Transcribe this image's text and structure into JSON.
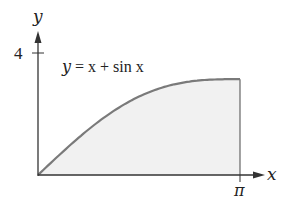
{
  "chart_data": {
    "type": "area",
    "title": "",
    "annotation": "y = x + sin x",
    "xlabel": "x",
    "ylabel": "y",
    "x_ticks": [
      {
        "value": 3.14159,
        "label": "π"
      }
    ],
    "y_ticks": [
      {
        "value": 4,
        "label": "4"
      }
    ],
    "xlim": [
      0,
      3.14159
    ],
    "ylim": [
      0,
      4
    ],
    "grid": false,
    "legend": "none",
    "function": "x + sin(x)",
    "shaded_region": {
      "from": 0,
      "to": 3.14159,
      "description": "area under curve between x=0 and x=π"
    },
    "x": [
      0,
      0.3927,
      0.7854,
      1.1781,
      1.5708,
      1.9635,
      2.3562,
      2.7489,
      3.1416
    ],
    "values": [
      0,
      0.775,
      1.492,
      2.102,
      2.571,
      2.887,
      3.063,
      3.132,
      3.142
    ],
    "colors": {
      "curve": "#7a7a7a",
      "fill": "#f1f1f1",
      "axes": "#333333"
    }
  },
  "labels": {
    "y_axis": "y",
    "x_axis": "x",
    "y_tick": "4",
    "x_tick": "π",
    "equation_y": "y",
    "equation_rest": " = x + sin x"
  }
}
